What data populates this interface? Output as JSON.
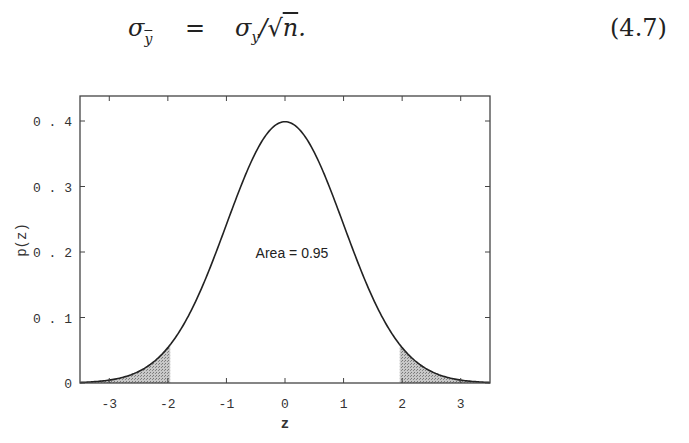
{
  "equation": {
    "lhs": "σ",
    "lhs_sub": "y",
    "equals": "=",
    "rhs": "σ",
    "rhs_sub": "y",
    "rhs_rest_prefix": "/",
    "sqrt_symbol": "√",
    "radicand": "n",
    "suffix": ".",
    "number": "(4.7)"
  },
  "chart_data": {
    "type": "area",
    "title": "",
    "xlabel": "z",
    "ylabel": "p(z)",
    "xlim": [
      -3.5,
      3.5
    ],
    "ylim": [
      0,
      0.43
    ],
    "x_ticks": [
      -3,
      -2,
      -1,
      0,
      1,
      2,
      3
    ],
    "x_tick_labels": [
      "-3",
      "-2",
      "-1",
      "0",
      "1",
      "2",
      "3"
    ],
    "y_ticks": [
      0,
      0.1,
      0.2,
      0.3,
      0.4
    ],
    "y_tick_labels": [
      "0",
      "0.1",
      "0.2",
      "0.3",
      "0.4"
    ],
    "grid": false,
    "series": [
      {
        "name": "standard normal density",
        "function": "p(z) = exp(-z^2/2)/sqrt(2*pi)",
        "x": [
          -3.5,
          -3,
          -2.5,
          -2,
          -1.5,
          -1,
          -0.5,
          0,
          0.5,
          1,
          1.5,
          2,
          2.5,
          3,
          3.5
        ],
        "values": [
          0.0009,
          0.0044,
          0.0175,
          0.054,
          0.1295,
          0.242,
          0.3521,
          0.3989,
          0.3521,
          0.242,
          0.1295,
          0.054,
          0.0175,
          0.0044,
          0.0009
        ]
      }
    ],
    "shaded_regions": [
      {
        "from": -3.5,
        "to": -1.96,
        "fill": "#b5b5b5"
      },
      {
        "from": 1.96,
        "to": 3.5,
        "fill": "#b5b5b5"
      }
    ],
    "annotations": [
      {
        "text": "Area = 0.95",
        "x": 0,
        "y": 0.2
      }
    ],
    "colors": {
      "line": "#222222",
      "shade": "#b5b5b5",
      "axis": "#444444"
    }
  }
}
